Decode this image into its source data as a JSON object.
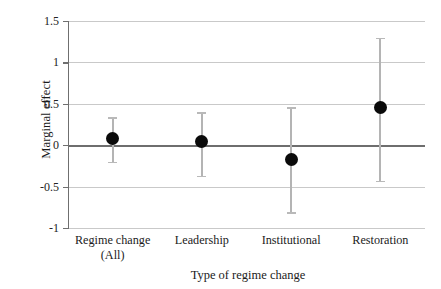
{
  "chart_data": {
    "type": "scatter",
    "title": "",
    "xlabel": "Type of regime change",
    "ylabel": "Marginal effect",
    "categories": [
      "Regime change\n(All)",
      "Leadership",
      "Institutional",
      "Restoration"
    ],
    "category_lines": [
      [
        "Regime change",
        "(All)"
      ],
      [
        "Leadership"
      ],
      [
        "Institutional"
      ],
      [
        "Restoration"
      ]
    ],
    "values": [
      0.08,
      0.05,
      -0.17,
      0.46
    ],
    "ci_low": [
      -0.2,
      -0.37,
      -0.81,
      -0.43
    ],
    "ci_high": [
      0.34,
      0.4,
      0.46,
      1.3
    ],
    "ylim": [
      -1,
      1.5
    ],
    "yticks": [
      1.5,
      1,
      0.5,
      0,
      -0.5,
      -1
    ],
    "ytick_labels": [
      "1.5",
      "1",
      "0.5",
      "0",
      "-0.5",
      "-1"
    ],
    "grid": true,
    "reference_line": 0,
    "legend": "none",
    "marker": "filled-circle",
    "colors": {
      "marker": "#0a0a0a",
      "whisker": "#b4b4b4",
      "gridline": "#c9c9c9",
      "zeroline": "#6e6e6e",
      "axis": "#6f6f6f",
      "text": "#1b1b1b",
      "background": "#ffffff"
    }
  }
}
